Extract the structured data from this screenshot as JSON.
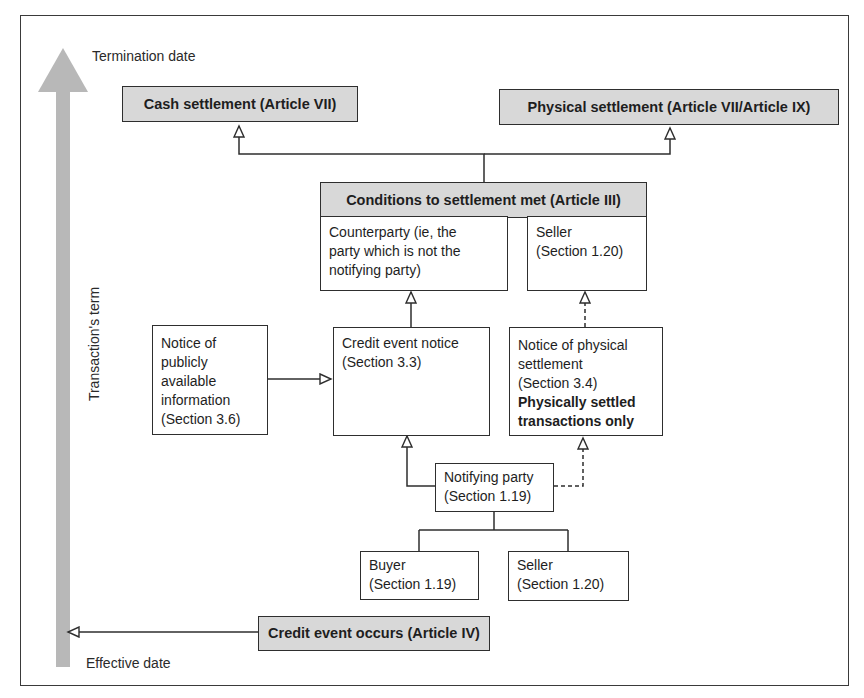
{
  "timeline": {
    "top_label": "Termination date",
    "bottom_label": "Effective date",
    "axis_label": "Transaction's term",
    "arrow_color": "#b8b8b8"
  },
  "nodes": {
    "cash_settlement": {
      "label": "Cash settlement (Article VII)"
    },
    "physical_settlement": {
      "label": "Physical settlement (Article VII/Article IX)"
    },
    "conditions": {
      "label": "Conditions to settlement met (Article III)"
    },
    "counterparty": {
      "line1": "Counterparty (ie, the",
      "line2": "party which is not the",
      "line3": "notifying party)"
    },
    "seller_top": {
      "line1": "Seller",
      "line2": "(Section 1.20)"
    },
    "public_info": {
      "line1": "Notice of",
      "line2": "publicly",
      "line3": "available",
      "line4": "information",
      "line5": "(Section 3.6)"
    },
    "credit_event_notice": {
      "line1": "Credit event notice",
      "line2": "(Section 3.3)"
    },
    "physical_notice": {
      "line1": "Notice of physical",
      "line2": "settlement",
      "line3": "(Section 3.4)",
      "bold1": "Physically settled",
      "bold2": "transactions only"
    },
    "notifying_party": {
      "line1": "Notifying party",
      "line2": "(Section 1.19)"
    },
    "buyer": {
      "line1": "Buyer",
      "line2": "(Section 1.19)"
    },
    "seller_bottom": {
      "line1": "Seller",
      "line2": "(Section 1.20)"
    },
    "credit_event_occurs": {
      "label": "Credit event occurs (Article IV)"
    }
  },
  "colors": {
    "box_fill_grey": "#d8d8d8",
    "box_border": "#2e2e2e",
    "line": "#2e2e2e"
  }
}
